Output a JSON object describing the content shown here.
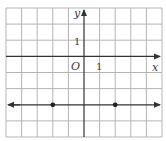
{
  "diagram": {
    "type": "coordinate-grid-line-graph",
    "axes": {
      "x_label": "x",
      "y_label": "y",
      "origin_label": "O",
      "x_tick_label": "1",
      "y_tick_label": "1"
    },
    "grid": {
      "x_min": -5,
      "x_max": 5,
      "y_min": -5,
      "y_max": 3,
      "unit": 1
    },
    "line": {
      "equation": "y = -3",
      "type": "horizontal",
      "y": -3,
      "arrows": "both"
    },
    "points": [
      {
        "x": -2,
        "y": -3
      },
      {
        "x": 2,
        "y": -3
      }
    ],
    "colors": {
      "grid": "#b5b5b5",
      "axis": "#333333",
      "line": "#333333",
      "point": "#222222"
    }
  }
}
